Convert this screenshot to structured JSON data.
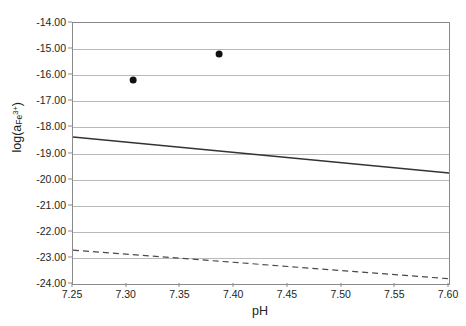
{
  "chart_data": {
    "type": "scatter",
    "title": "",
    "xlabel": "pH",
    "ylabel_text": "log(a",
    "ylabel_sub": "Fe",
    "ylabel_sup": "3+",
    "ylabel_close": ")",
    "ylabel_plain": "log(aFe3+)",
    "xlim": [
      7.25,
      7.6
    ],
    "ylim": [
      -24.0,
      -14.0
    ],
    "xticks": [
      "7.25",
      "7.30",
      "7.35",
      "7.40",
      "7.45",
      "7.50",
      "7.55",
      "7.60"
    ],
    "xtick_values": [
      7.25,
      7.3,
      7.35,
      7.4,
      7.45,
      7.5,
      7.55,
      7.6
    ],
    "yticks": [
      "-14.00",
      "-15.00",
      "-16.00",
      "-17.00",
      "-18.00",
      "-19.00",
      "-20.00",
      "-21.00",
      "-22.00",
      "-23.00",
      "-24.00"
    ],
    "ytick_values": [
      -14,
      -15,
      -16,
      -17,
      -18,
      -19,
      -20,
      -21,
      -22,
      -23,
      -24
    ],
    "grid": "horizontal",
    "grid_color": "#b9b9b9",
    "axis_color": "#8a8a8a",
    "legend": "none",
    "series": [
      {
        "name": "measured points",
        "type": "scatter",
        "marker": "filled-circle",
        "color": "#111111",
        "marker_size": 7,
        "points": [
          {
            "x": 7.306,
            "y": -16.18
          },
          {
            "x": 7.386,
            "y": -15.19
          }
        ]
      },
      {
        "name": "solid model line",
        "type": "line",
        "style": "solid",
        "color": "#333333",
        "width": 1.4,
        "points": [
          {
            "x": 7.25,
            "y": -18.37
          },
          {
            "x": 7.6,
            "y": -19.75
          }
        ]
      },
      {
        "name": "dashed model line",
        "type": "line",
        "style": "dashed",
        "color": "#4a4a4a",
        "width": 1.2,
        "dash": "6 4",
        "points": [
          {
            "x": 7.25,
            "y": -22.7
          },
          {
            "x": 7.6,
            "y": -23.8
          }
        ]
      }
    ]
  }
}
